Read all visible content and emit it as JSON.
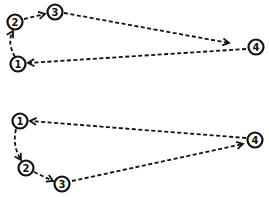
{
  "diagrams": [
    {
      "name": "top-cycle",
      "nodes": [
        {
          "id": "1",
          "label": "1"
        },
        {
          "id": "2",
          "label": "2"
        },
        {
          "id": "3",
          "label": "3"
        },
        {
          "id": "4",
          "label": "4"
        }
      ],
      "edges": [
        {
          "from": "1",
          "to": "2",
          "style": "dashed-arrow"
        },
        {
          "from": "2",
          "to": "3",
          "style": "dashed-arrow"
        },
        {
          "from": "3",
          "to": "4",
          "style": "dashed-arrow"
        },
        {
          "from": "4",
          "to": "1",
          "style": "dashed-arrow"
        }
      ]
    },
    {
      "name": "bottom-cycle",
      "nodes": [
        {
          "id": "1",
          "label": "1"
        },
        {
          "id": "2",
          "label": "2"
        },
        {
          "id": "3",
          "label": "3"
        },
        {
          "id": "4",
          "label": "4"
        }
      ],
      "edges": [
        {
          "from": "1",
          "to": "2",
          "style": "dashed-arrow"
        },
        {
          "from": "2",
          "to": "3",
          "style": "dashed-arrow"
        },
        {
          "from": "3",
          "to": "4",
          "style": "dashed-arrow"
        },
        {
          "from": "4",
          "to": "1",
          "style": "dashed-arrow"
        }
      ]
    }
  ],
  "colors": {
    "stroke": "#111111",
    "background": "#ffffff"
  }
}
